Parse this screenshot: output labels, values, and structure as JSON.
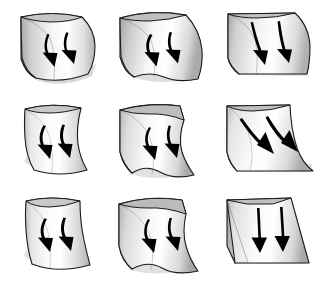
{
  "figure": {
    "type": "diagram-grid",
    "rows": 3,
    "columns": 3,
    "background_color": "#ffffff",
    "palette": {
      "outline": "#111111",
      "arrow": "#000000",
      "side_face_light": "#d8d8d8",
      "side_face_dark": "#9a9a9a",
      "surface_light": "#ffffff",
      "surface_mid": "#e2e2e2",
      "surface_dark": "#9e9e9e",
      "shadow": "#cfcfcf"
    },
    "cells": [
      {
        "id": "cell-r1c1",
        "row": 1,
        "column": 1,
        "surface_shape": "convex-dome",
        "profile": "convex",
        "cross_section": "convex",
        "arrow_count": 2,
        "arrow_style": "curved-converging",
        "arrow_direction": "down-inward",
        "has_side_face": true,
        "label": "convex-convex"
      },
      {
        "id": "cell-r1c2",
        "row": 1,
        "column": 2,
        "surface_shape": "convex-ridge-flared",
        "profile": "convex",
        "cross_section": "flat",
        "arrow_count": 2,
        "arrow_style": "curved-converging",
        "arrow_direction": "down-inward",
        "has_side_face": true,
        "label": "convex-flat"
      },
      {
        "id": "cell-r1c3",
        "row": 1,
        "column": 3,
        "surface_shape": "convex-cylinder",
        "profile": "convex",
        "cross_section": "concave",
        "arrow_count": 2,
        "arrow_style": "straight-parallel",
        "arrow_direction": "down",
        "has_side_face": true,
        "label": "convex-concave"
      },
      {
        "id": "cell-r2c1",
        "row": 2,
        "column": 1,
        "surface_shape": "flat-saddle-convex",
        "profile": "flat",
        "cross_section": "convex",
        "arrow_count": 2,
        "arrow_style": "curved-converging",
        "arrow_direction": "down-inward",
        "has_side_face": false,
        "label": "flat-convex"
      },
      {
        "id": "cell-r2c2",
        "row": 2,
        "column": 2,
        "surface_shape": "flat-plane-wavy",
        "profile": "flat",
        "cross_section": "flat",
        "arrow_count": 2,
        "arrow_style": "curved-converging",
        "arrow_direction": "down-inward",
        "has_side_face": true,
        "label": "flat-flat"
      },
      {
        "id": "cell-r2c3",
        "row": 2,
        "column": 3,
        "surface_shape": "flat-concave-drape",
        "profile": "flat",
        "cross_section": "concave",
        "arrow_count": 2,
        "arrow_style": "straight-diverging",
        "arrow_direction": "down-right",
        "has_side_face": true,
        "label": "flat-concave"
      },
      {
        "id": "cell-r3c1",
        "row": 3,
        "column": 1,
        "surface_shape": "concave-convex-taper",
        "profile": "concave",
        "cross_section": "convex",
        "arrow_count": 2,
        "arrow_style": "curved-converging",
        "arrow_direction": "down-inward",
        "has_side_face": false,
        "label": "concave-convex"
      },
      {
        "id": "cell-r3c2",
        "row": 3,
        "column": 2,
        "surface_shape": "concave-flat-fan",
        "profile": "concave",
        "cross_section": "flat",
        "arrow_count": 2,
        "arrow_style": "curved-converging",
        "arrow_direction": "down-inward",
        "has_side_face": true,
        "label": "concave-flat"
      },
      {
        "id": "cell-r3c3",
        "row": 3,
        "column": 3,
        "surface_shape": "planar-wedge",
        "profile": "concave",
        "cross_section": "concave",
        "arrow_count": 2,
        "arrow_style": "straight-parallel",
        "arrow_direction": "down",
        "has_side_face": true,
        "label": "concave-concave"
      }
    ]
  }
}
